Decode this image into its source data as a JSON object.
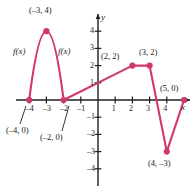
{
  "chart_data": {
    "type": "line",
    "title": "",
    "xlabel": "x",
    "ylabel": "y",
    "xlim": [
      -4.8,
      5.6
    ],
    "ylim": [
      -4.8,
      4.8
    ],
    "grid": false,
    "legend": null,
    "function_label": "f(x)",
    "series": [
      {
        "name": "f(x)",
        "x": [
          -4,
          -3.5,
          -3,
          -2.5,
          -2,
          2,
          3,
          4,
          5
        ],
        "y": [
          0,
          3,
          4,
          3,
          0,
          2,
          2,
          -3,
          0
        ],
        "points": [
          {
            "x": -4,
            "y": 0,
            "label": "(–4, 0)",
            "marked": true
          },
          {
            "x": -3,
            "y": 4,
            "label": "(–3, 4)",
            "marked": true
          },
          {
            "x": -2,
            "y": 0,
            "label": "(–2, 0)",
            "marked": true
          },
          {
            "x": 2,
            "y": 2,
            "label": "(2, 2)",
            "marked": true
          },
          {
            "x": 3,
            "y": 2,
            "label": "(3, 2)",
            "marked": true
          },
          {
            "x": 4,
            "y": -3,
            "label": "(4, –3)",
            "marked": true
          },
          {
            "x": 5,
            "y": 0,
            "label": "(5, 0)",
            "marked": true
          }
        ]
      }
    ],
    "xticks": [
      {
        "value": -4,
        "label": "–4"
      },
      {
        "value": -3,
        "label": "–3"
      },
      {
        "value": -2,
        "label": "–2"
      },
      {
        "value": -1,
        "label": "–1"
      },
      {
        "value": 1,
        "label": "1"
      },
      {
        "value": 2,
        "label": "2"
      },
      {
        "value": 3,
        "label": "3"
      },
      {
        "value": 4,
        "label": "4"
      }
    ],
    "yticks": [
      {
        "value": 4,
        "label": "4"
      },
      {
        "value": 3,
        "label": "3"
      },
      {
        "value": 2,
        "label": "2"
      },
      {
        "value": 1,
        "label": "1"
      },
      {
        "value": -1,
        "label": "–1"
      },
      {
        "value": -2,
        "label": "–2"
      },
      {
        "value": -3,
        "label": "–3"
      },
      {
        "value": -4,
        "label": "–4"
      }
    ],
    "annotations": [
      {
        "text": "f(x)",
        "x": -4.1,
        "y": 3.0
      },
      {
        "text": "f(x)",
        "x": -1.85,
        "y": 3.0
      }
    ],
    "colors": {
      "curve": "#d1386b",
      "point": "#d1386b",
      "axis": "#231f20",
      "text": "#1a1a1a",
      "background": "#ffffff"
    }
  }
}
